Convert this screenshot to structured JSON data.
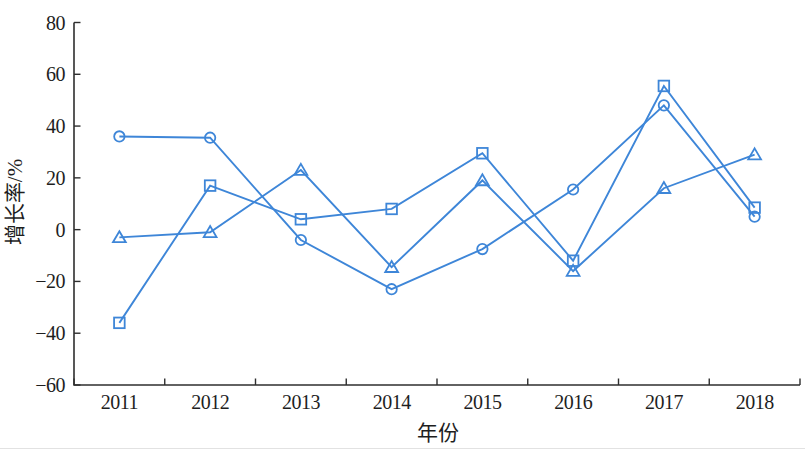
{
  "figure": {
    "background": "#ffffff"
  },
  "chart_data": {
    "type": "line",
    "title": "",
    "xlabel": "年份",
    "ylabel": "增长率/%",
    "categories": [
      "2011",
      "2012",
      "2013",
      "2014",
      "2015",
      "2016",
      "2017",
      "2018"
    ],
    "ylim": [
      -60,
      80
    ],
    "yticks": [
      {
        "value": 80,
        "label": "80"
      },
      {
        "value": 60,
        "label": "60"
      },
      {
        "value": 40,
        "label": "40"
      },
      {
        "value": 20,
        "label": "20"
      },
      {
        "value": 0,
        "label": "0"
      },
      {
        "value": -20,
        "label": "−20"
      },
      {
        "value": -40,
        "label": "−40"
      },
      {
        "value": -60,
        "label": "−60"
      }
    ],
    "grid": false,
    "legend": "none",
    "series": [
      {
        "name": "series-circle",
        "marker": "circle",
        "values": [
          36,
          35.5,
          -4,
          -23,
          -7.5,
          15.5,
          48,
          5
        ]
      },
      {
        "name": "series-square",
        "marker": "square",
        "values": [
          -36,
          17,
          4,
          8,
          29.5,
          -12,
          55.5,
          8.5
        ]
      },
      {
        "name": "series-triangle",
        "marker": "triangle",
        "values": [
          -3,
          -1,
          23,
          -14.5,
          19,
          -16,
          16,
          29
        ]
      }
    ],
    "colors": {
      "series": "#3e86d8",
      "axis": "#2f2f2f",
      "text": "#1e1e1e"
    }
  }
}
